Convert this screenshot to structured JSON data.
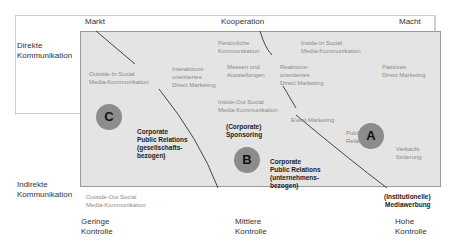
{
  "top_axis": {
    "left": "Markt",
    "center": "Kooperation",
    "right": "Macht"
  },
  "left_axis": {
    "top": "Direkte\nKommunikation",
    "bottom": "Indirekte\nKommunikation"
  },
  "bottom_axis": {
    "left": "Geringe\nKontrolle",
    "center": "Mittlere\nKontrolle",
    "right": "Hohe\nKontrolle"
  },
  "circles": {
    "a": "A",
    "b": "B",
    "c": "C"
  },
  "labels": {
    "outside_in": "Outside-In Social\nMedia-Kommunikation",
    "interaktions": "Interaktions-\norientiertes\nDirect Marketing",
    "persoenliche": "Persönliche\nKommunikation",
    "messen": "Messen und\nAusstellungen",
    "inside_in": "Inside-In Social\nMedia-Kommunikation",
    "reaktions": "Reaktions-\norientiertes\nDirect Marketing",
    "passives": "Passives\nDirect Marketing",
    "inside_out": "Inside-Out Social\nMedia-Kommunikation",
    "event": "Event Marketing",
    "public_relations": "Public\nRelations",
    "verkauf": "Verkaufs-\nförderung",
    "outside_out": "Outside-Out Social\nMedia-Kommunikation"
  },
  "bold_labels": {
    "cpr_gesellschaft": "Corporate\nPublic Relations\n(gesellschafts-\nbezogen)",
    "sponsoring": "(Corporate)\nSponsoring",
    "cpr_unternehmen": "Corporate\nPublic Relations\n(unternehmens-\nbezogen)",
    "mediawerbung": "(Institutionelle)\nMediawerbung"
  }
}
